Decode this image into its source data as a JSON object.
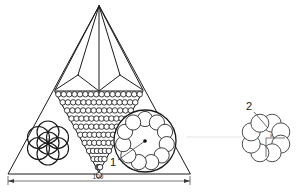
{
  "drawing": {
    "title": "Pyramid cross-section with packed circular elements",
    "background_color": "#ffffff",
    "line_color": "#1a1a1a",
    "faint_line_color": "#d8d8d8"
  },
  "callouts": [
    {
      "id": "callout-1",
      "label": "1",
      "x": 113,
      "y": 163,
      "target_x": 146,
      "target_y": 141
    },
    {
      "id": "callout-2",
      "label": "2",
      "x": 249,
      "y": 106,
      "target_x": 265,
      "target_y": 120
    }
  ],
  "dimensions": [
    {
      "id": "overall-width",
      "label": "100",
      "value": 100,
      "x": 98,
      "y": 186,
      "start_x": 8,
      "end_x": 190,
      "y_line": 181
    }
  ],
  "diameter_symbol": {
    "glyph": "ø",
    "x": 268,
    "y": 137
  },
  "main_view": {
    "name": "pyramid-section",
    "apex": {
      "x": 99,
      "y": 6
    },
    "base_left": {
      "x": 8,
      "y": 174
    },
    "base_right": {
      "x": 190,
      "y": 174
    },
    "facet_left": {
      "x": 55,
      "y": 90
    },
    "facet_right": {
      "x": 143,
      "y": 90
    },
    "facet_mid_left": {
      "x": 78,
      "y": 75
    },
    "facet_mid_right": {
      "x": 120,
      "y": 75
    }
  },
  "packed_triangle": {
    "name": "hex-packed-inverted-triangle",
    "top_left_x": 55,
    "top_right_x": 143,
    "top_y": 91,
    "apex_x": 99,
    "apex_y": 172,
    "rows": 11,
    "top_row_count": 16,
    "circle_radius": 2.75
  },
  "left_rosette": {
    "name": "overlapping-circle-rosette",
    "center_x": 48,
    "center_y": 143,
    "ring_count": 6,
    "ring_radius": 11,
    "circle_radius": 11,
    "has_center_circle": true
  },
  "right_strand": {
    "name": "wire-strand-cluster",
    "center_x": 145,
    "center_y": 141,
    "outer_radius": 31,
    "inner_count": 11,
    "inner_circle_radius": 7.6,
    "ring_radius": 22,
    "center_dot_radius": 1.8,
    "has_radius_leader": true
  },
  "detail_view": {
    "name": "detail-2-strand",
    "center_x": 266,
    "center_y": 138,
    "ring_count": 8,
    "ring_radius": 16,
    "circle_radius": 9,
    "center_dot_radius": 1.2,
    "has_diameter_line": true
  },
  "connector": {
    "name": "view-connector-line",
    "start_x": 186,
    "start_y": 137,
    "end_x": 243,
    "end_y": 137
  }
}
